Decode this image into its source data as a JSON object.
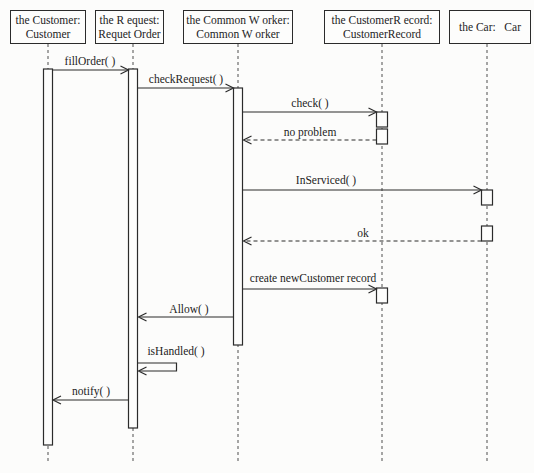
{
  "diagram_type": "uml-sequence-diagram",
  "lifelines": [
    {
      "id": "customer",
      "line1": "the Customer:",
      "line2": "Customer"
    },
    {
      "id": "request",
      "line1": "the R equest:",
      "line2": "Requet Order"
    },
    {
      "id": "common-worker",
      "line1": "the Common W orker:",
      "line2": "Common W orker"
    },
    {
      "id": "customer-record",
      "line1": "the CustomerR ecord:",
      "line2": "CustomerRecord"
    },
    {
      "id": "car",
      "line1": "the Car:   Car",
      "line2": ""
    }
  ],
  "messages": [
    {
      "label": "fillOrder( )",
      "from": "the Customer",
      "to": "the R equest",
      "line": "solid",
      "direction": "right"
    },
    {
      "label": "checkRequest( )",
      "from": "the R equest",
      "to": "the Common W orker",
      "line": "solid",
      "direction": "right"
    },
    {
      "label": "check( )",
      "from": "the Common W orker",
      "to": "the CustomerR ecord",
      "line": "solid",
      "direction": "right"
    },
    {
      "label": "no problem",
      "from": "the CustomerR ecord",
      "to": "the Common W orker",
      "line": "dashed",
      "direction": "left"
    },
    {
      "label": "InServiced( )",
      "from": "the Common W orker",
      "to": "the Car",
      "line": "solid",
      "direction": "right"
    },
    {
      "label": "ok",
      "from": "the Car",
      "to": "the Common W orker",
      "line": "dashed",
      "direction": "left"
    },
    {
      "label": "create newCustomer record",
      "from": "the Common W orker",
      "to": "the CustomerR ecord",
      "line": "solid",
      "direction": "right"
    },
    {
      "label": "Allow( )",
      "from": "the Common W orker",
      "to": "the R equest",
      "line": "solid",
      "direction": "left"
    },
    {
      "label": "isHandled( )",
      "from": "the R equest",
      "to": "the R equest",
      "line": "solid",
      "direction": "self"
    },
    {
      "label": "notify( )",
      "from": "the R equest",
      "to": "the Customer",
      "line": "solid",
      "direction": "left"
    }
  ],
  "colors": {
    "line": "#2b2b2b",
    "lifeline": "#4f4f4f",
    "background": "#fcfcfb",
    "box_fill": "#fdfdfc",
    "text": "#1c1c1c"
  }
}
